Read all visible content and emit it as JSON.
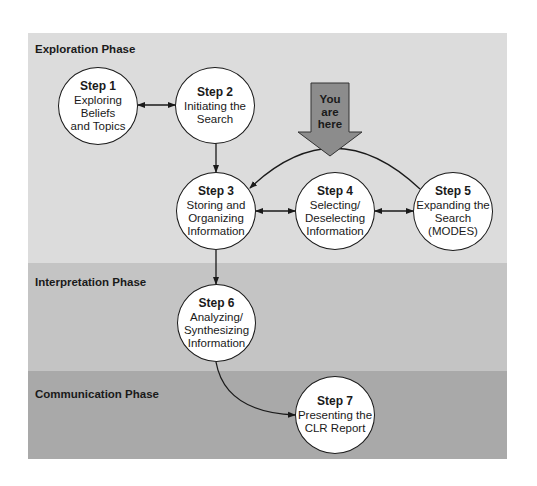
{
  "phases": [
    {
      "label": "Exploration Phase",
      "color": "#dcdcdc"
    },
    {
      "label": "Interpretation Phase",
      "color": "#c3c3c3"
    },
    {
      "label": "Communication Phase",
      "color": "#a9a9a9"
    }
  ],
  "steps": [
    {
      "step": "Step 1",
      "desc": "Exploring\nBeliefs\nand Topics"
    },
    {
      "step": "Step 2",
      "desc": "Initiating the\nSearch"
    },
    {
      "step": "Step 3",
      "desc": "Storing and\nOrganizing\nInformation"
    },
    {
      "step": "Step 4",
      "desc": "Selecting/\nDeselecting\nInformation"
    },
    {
      "step": "Step 5",
      "desc": "Expanding the\nSearch\n(MODES)"
    },
    {
      "step": "Step 6",
      "desc": "Analyzing/\nSynthesizing\nInformation"
    },
    {
      "step": "Step 7",
      "desc": "Presenting the\nCLR Report"
    }
  ],
  "marker": {
    "label": "You\nare\nhere",
    "color": "#8c8c8c"
  }
}
